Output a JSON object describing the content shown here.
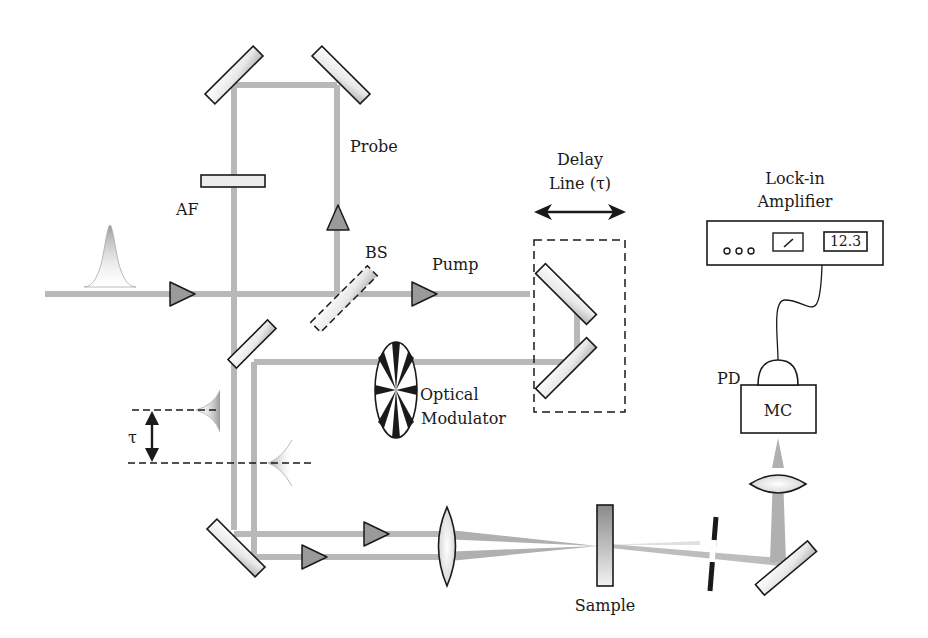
{
  "diagram": {
    "type": "pump-probe optical setup",
    "labels": {
      "probe": "Probe",
      "af": "AF",
      "bs": "BS",
      "pump": "Pump",
      "delay_line_1": "Delay",
      "delay_line_2": "Line (τ)",
      "lockin_1": "Lock-in",
      "lockin_2": "Amplifier",
      "lockin_display": "12.3",
      "optical_modulator_1": "Optical",
      "optical_modulator_2": "Modulator",
      "tau": "τ",
      "pd": "PD",
      "mc": "MC",
      "sample": "Sample"
    },
    "colors": {
      "beam": "#b8b8b8",
      "arrow_fill": "#9a9a9a",
      "outline": "#1a1a1a",
      "background": "#ffffff"
    }
  }
}
